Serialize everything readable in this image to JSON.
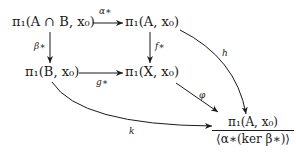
{
  "diagram": {
    "type": "commutative-diagram",
    "nodes": {
      "intersection": "π₁(A ∩ B, x₀)",
      "pi1_A": "π₁(A, x₀)",
      "pi1_B": "π₁(B, x₀)",
      "pi1_X": "π₁(X, x₀)",
      "quotient_numerator": "π₁(A, x₀)",
      "quotient_denominator": "⟨α∗(ker β∗)⟩"
    },
    "edges": [
      {
        "id": "alpha",
        "from": "intersection",
        "to": "pi1_A",
        "label": "α∗"
      },
      {
        "id": "beta",
        "from": "intersection",
        "to": "pi1_B",
        "label": "β∗"
      },
      {
        "id": "f",
        "from": "pi1_A",
        "to": "pi1_X",
        "label": "f∗"
      },
      {
        "id": "g",
        "from": "pi1_B",
        "to": "pi1_X",
        "label": "g∗"
      },
      {
        "id": "h",
        "from": "pi1_A",
        "to": "quotient",
        "label": "h"
      },
      {
        "id": "phi",
        "from": "pi1_X",
        "to": "quotient",
        "label": "φ"
      },
      {
        "id": "k",
        "from": "pi1_B",
        "to": "quotient",
        "label": "k"
      }
    ],
    "colors": {
      "ink": "#1a1a1a",
      "background": "#ffffff"
    }
  }
}
